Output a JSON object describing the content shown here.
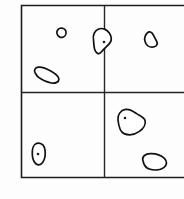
{
  "figure": {
    "background_color": "#fdfdfd",
    "ink_color": "#111111",
    "frame": {
      "name": "outer-rectangle",
      "x": 21,
      "y": 5,
      "width": 163,
      "height": 172,
      "stroke_color": "#1d1d1d",
      "stroke_width": 1.6,
      "right_edge_cropped": true
    },
    "dividers": [
      {
        "name": "vertical-divider",
        "orientation": "vertical",
        "position": 104,
        "from": 5,
        "to": 177,
        "stroke_color": "#262626"
      },
      {
        "name": "horizontal-divider",
        "orientation": "horizontal",
        "position": 92,
        "from": 21,
        "to": 184,
        "stroke_color": "#262626"
      }
    ],
    "quadrants": [
      {
        "name": "top-left",
        "shape_count": 3
      },
      {
        "name": "top-right",
        "shape_count": 2
      },
      {
        "name": "bottom-left",
        "shape_count": 1
      },
      {
        "name": "bottom-right",
        "shape_count": 2
      }
    ],
    "shapes": [
      {
        "id": "blob-small-oval-topleft",
        "quadrant": "top-left",
        "center": [
          61,
          33
        ],
        "size": "small",
        "has_dot": false,
        "path": "M 57.0 33.6 C 56.4 31.2 57.8 28.9 60.2 28.3 C 62.8 27.7 65.3 29.0 65.9 31.2 C 66.5 33.6 65.4 36.3 63.0 37.2 C 60.4 38.1 57.6 36.2 57.0 33.6 Z"
      },
      {
        "id": "blob-straddling-divider",
        "quadrant": "top-left/top-right",
        "center": [
          101,
          41
        ],
        "size": "medium",
        "has_dot": true,
        "dot": [
          104,
          42
        ],
        "straddles_divider": true,
        "path": "M 93.5 40.0 C 92.6 35.1 94.7 30.4 98.6 29.0 C 102.6 27.6 107.0 29.5 109.3 33.0 C 111.4 36.2 111.8 39.9 110.2 42.5 C 108.4 45.5 104.8 47.6 101.3 52.0 C 98.8 55.1 95.8 53.5 94.6 49.3 C 93.8 46.4 93.8 43.0 93.5 40.0 Z"
      },
      {
        "id": "blob-teardrop-topright",
        "quadrant": "top-right",
        "center": [
          151,
          39
        ],
        "size": "small",
        "has_dot": false,
        "path": "M 146.0 34.5 C 147.8 31.6 150.2 31.0 152.1 33.1 C 153.7 34.9 154.8 38.2 156.4 40.7 C 158.0 43.3 157.2 46.0 154.3 46.8 C 151.0 47.7 147.3 46.3 145.8 43.3 C 144.4 40.6 144.5 36.9 146.0 34.5 Z"
      },
      {
        "id": "blob-elongated-bean-topleft",
        "quadrant": "top-left",
        "center": [
          47,
          76
        ],
        "size": "medium",
        "has_dot": false,
        "orientation": "diagonal",
        "path": "M 35.2 72.9 C 33.5 70.5 35.0 67.6 38.3 67.2 C 42.0 66.8 46.6 68.6 51.2 71.3 C 55.6 73.9 58.9 76.5 58.9 79.2 C 58.9 82.0 55.4 83.6 51.4 83.0 C 46.9 82.3 42.0 79.9 38.6 77.4 C 36.7 76.0 35.9 74.0 35.2 72.9 Z"
      },
      {
        "id": "blob-oval-with-dot-bottomleft",
        "quadrant": "bottom-left",
        "center": [
          38,
          154
        ],
        "size": "small",
        "has_dot": true,
        "dot": [
          38,
          154
        ],
        "orientation": "vertical",
        "path": "M 32.4 150.4 C 32.8 146.0 35.3 143.0 38.6 143.2 C 42.0 143.4 44.6 146.3 45.1 150.6 C 45.6 154.8 44.7 159.6 42.6 162.6 C 40.5 165.6 37.2 165.6 35.0 162.9 C 32.6 159.9 32.0 154.6 32.4 150.4 Z"
      },
      {
        "id": "blob-large-with-dot-bottomright",
        "quadrant": "bottom-right",
        "center": [
          131,
          122
        ],
        "size": "large",
        "has_dot": true,
        "dot": [
          125,
          118
        ],
        "path": "M 118.0 120.0 C 117.2 115.0 120.6 110.2 125.6 109.4 C 130.0 108.7 133.3 111.5 136.6 113.6 C 140.3 115.9 144.0 117.0 145.0 120.2 C 146.1 123.8 143.6 128.4 139.4 131.4 C 134.6 134.8 128.6 135.6 124.0 133.6 C 119.8 131.8 118.6 125.6 118.0 120.0 Z"
      },
      {
        "id": "blob-elongated-bean-bottomright",
        "quadrant": "bottom-right",
        "center": [
          154,
          162
        ],
        "size": "medium",
        "has_dot": false,
        "orientation": "horizontal",
        "path": "M 142.8 160.0 C 142.0 156.4 145.4 153.8 150.4 153.6 C 155.6 153.4 161.2 155.4 164.4 158.4 C 167.4 161.2 167.2 165.2 163.8 167.6 C 160.2 170.2 154.0 170.6 149.2 169.0 C 145.0 167.6 143.4 163.4 142.8 160.0 Z"
      }
    ],
    "caption": ""
  }
}
